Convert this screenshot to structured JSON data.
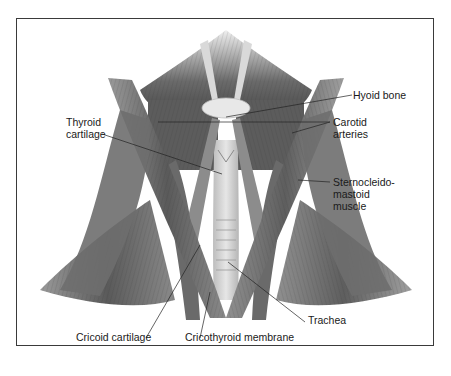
{
  "figure": {
    "colors": {
      "border": "#3a3a3a",
      "muscle_dark": "#3c3c3c",
      "muscle_mid": "#7a7a7a",
      "muscle_light": "#c8c8c8",
      "cartilage": "#e4e4e4",
      "leader": "#222222"
    },
    "labels": {
      "hyoid_bone": "Hyoid bone",
      "thyroid_cartilage_1": "Thyroid",
      "thyroid_cartilage_2": "cartilage",
      "carotid_arteries_1": "Carotid",
      "carotid_arteries_2": "arteries",
      "scm_1": "Sternocleido-",
      "scm_2": "mastoid",
      "scm_3": "muscle",
      "trachea": "Trachea",
      "cricoid_cartilage": "Cricoid cartilage",
      "cricothyroid_membrane": "Cricothyroid membrane"
    }
  }
}
